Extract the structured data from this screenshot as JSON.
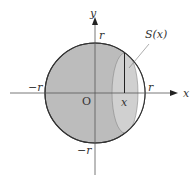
{
  "diagram": {
    "axes": {
      "x_label": "x",
      "y_label": "y",
      "origin_label": "O"
    },
    "ticks": {
      "x_pos": "r",
      "x_neg": "−r",
      "y_pos": "r",
      "y_neg": "−r"
    },
    "point_label": "x",
    "section_label": "S(x)",
    "colors": {
      "disk_fill": "#bdbdbd",
      "section_fill": "#cfcfcf",
      "stroke": "#333333"
    }
  }
}
